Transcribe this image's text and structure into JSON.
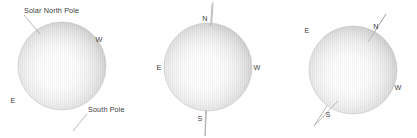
{
  "figure": {
    "background_color": "#ffffff",
    "label_color": "#3b3b3b",
    "line_color": "#a8a8a8",
    "sphere_edge_color": "#bdbdbd",
    "sphere_center_color": "#ffffff",
    "panels": [
      {
        "id": "panel-left",
        "name": "sun-disk-labeled-poles",
        "center_x": 62,
        "center_y": 66,
        "radius": 44,
        "axis_tilt_deg": 0,
        "axis_visible": false,
        "labels": [
          {
            "name": "solar-north-pole-label",
            "text": "Solar North Pole",
            "x": 24,
            "y": 13,
            "anchor": "start"
          },
          {
            "name": "west-label",
            "text": "W",
            "x": 99,
            "y": 42,
            "anchor": "middle"
          },
          {
            "name": "east-label",
            "text": "E",
            "x": 13,
            "y": 103,
            "anchor": "middle"
          },
          {
            "name": "south-pole-label",
            "text": "South Pole",
            "x": 88,
            "y": 112,
            "anchor": "start"
          }
        ],
        "leaders": [
          {
            "name": "north-pole-leader-line",
            "x1": 24,
            "y1": 15,
            "x2": 40,
            "y2": 34
          },
          {
            "name": "south-pole-leader-line",
            "x1": 87,
            "y1": 114,
            "x2": 73,
            "y2": 131
          }
        ]
      },
      {
        "id": "panel-middle",
        "name": "sun-disk-upright-axis",
        "center_x": 208,
        "center_y": 67,
        "radius": 44,
        "axis_tilt_deg": 3,
        "axis_visible": true,
        "axis": {
          "name": "rotation-axis-line",
          "x1": 213,
          "y1": 2,
          "x2": 205,
          "y2": 136
        },
        "labels": [
          {
            "name": "north-label",
            "text": "N",
            "x": 205,
            "y": 21,
            "anchor": "middle"
          },
          {
            "name": "east-label",
            "text": "E",
            "x": 159,
            "y": 70,
            "anchor": "middle"
          },
          {
            "name": "west-label",
            "text": "W",
            "x": 257,
            "y": 70,
            "anchor": "middle"
          },
          {
            "name": "south-label",
            "text": "S",
            "x": 200,
            "y": 121,
            "anchor": "middle"
          }
        ],
        "leaders": []
      },
      {
        "id": "panel-right",
        "name": "sun-disk-tilted-axis",
        "center_x": 353,
        "center_y": 70,
        "radius": 44,
        "axis_tilt_deg": 27,
        "axis_visible": true,
        "axis": {
          "name": "rotation-axis-line",
          "x1": 386,
          "y1": 14,
          "x2": 314,
          "y2": 126
        },
        "labels": [
          {
            "name": "north-label",
            "text": "N",
            "x": 376,
            "y": 29,
            "anchor": "middle"
          },
          {
            "name": "east-label",
            "text": "E",
            "x": 307,
            "y": 33,
            "anchor": "middle"
          },
          {
            "name": "west-label",
            "text": "W",
            "x": 398,
            "y": 90,
            "anchor": "middle"
          },
          {
            "name": "south-label",
            "text": "S",
            "x": 328,
            "y": 117,
            "anchor": "middle"
          }
        ],
        "leaders": []
      }
    ]
  }
}
